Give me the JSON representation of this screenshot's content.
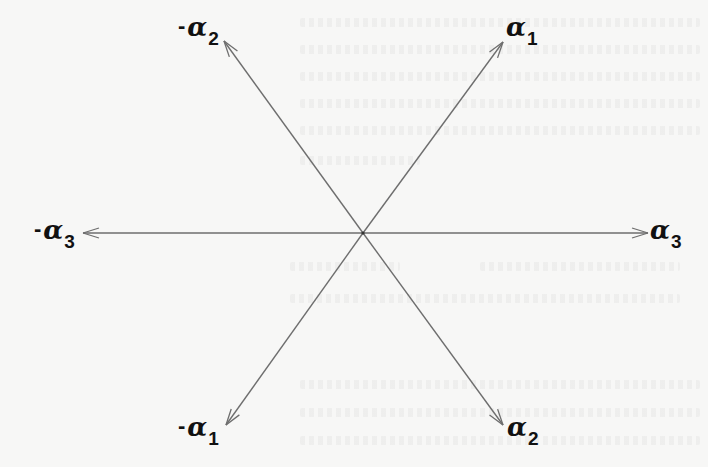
{
  "diagram": {
    "title": "",
    "type": "root-system",
    "center": {
      "x": 363,
      "y": 233
    },
    "colors": {
      "background": "#f7f7f6",
      "arrow": "#6e6e6e",
      "label": "#111111"
    },
    "arrows": [
      {
        "id": "alpha1",
        "tip": {
          "x": 503,
          "y": 42
        },
        "label": {
          "sign": "",
          "symbol": "α",
          "sub": "1"
        }
      },
      {
        "id": "neg-alpha2",
        "tip": {
          "x": 224,
          "y": 41
        },
        "label": {
          "sign": "-",
          "symbol": "α",
          "sub": "2"
        }
      },
      {
        "id": "alpha3",
        "tip": {
          "x": 648,
          "y": 233
        },
        "label": {
          "sign": "",
          "symbol": "α",
          "sub": "3"
        }
      },
      {
        "id": "neg-alpha3",
        "tip": {
          "x": 83,
          "y": 233
        },
        "label": {
          "sign": "-",
          "symbol": "α",
          "sub": "3"
        }
      },
      {
        "id": "neg-alpha1",
        "tip": {
          "x": 226,
          "y": 425
        },
        "label": {
          "sign": "-",
          "symbol": "α",
          "sub": "1"
        }
      },
      {
        "id": "alpha2",
        "tip": {
          "x": 503,
          "y": 425
        },
        "label": {
          "sign": "",
          "symbol": "α",
          "sub": "2"
        }
      }
    ]
  },
  "labels": {
    "alpha1": {
      "sign": "",
      "symbol": "α",
      "sub": "1"
    },
    "neg_alpha2": {
      "sign": "-",
      "symbol": "α",
      "sub": "2"
    },
    "alpha3": {
      "sign": "",
      "symbol": "α",
      "sub": "3"
    },
    "neg_alpha3": {
      "sign": "-",
      "symbol": "α",
      "sub": "3"
    },
    "neg_alpha1": {
      "sign": "-",
      "symbol": "α",
      "sub": "1"
    },
    "alpha2": {
      "sign": "",
      "symbol": "α",
      "sub": "2"
    }
  }
}
